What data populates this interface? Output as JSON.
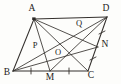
{
  "figure": {
    "type": "geometry-diagram",
    "shape": "parallelogram",
    "stroke_color": "#35312e",
    "label_color": "#1d1b19",
    "background_color": "#fdfdfb",
    "width": 121,
    "height": 84,
    "points": [
      {
        "name": "A",
        "label": "A",
        "x": 34,
        "y": 19,
        "label_x": 32,
        "label_y": 9,
        "kind": "vertex",
        "marked": true
      },
      {
        "name": "D",
        "label": "D",
        "x": 107,
        "y": 17,
        "label_x": 106,
        "label_y": 9,
        "kind": "vertex",
        "marked": false
      },
      {
        "name": "B",
        "label": "B",
        "x": 13,
        "y": 71,
        "label_x": 7,
        "label_y": 73,
        "kind": "vertex",
        "marked": false
      },
      {
        "name": "C",
        "label": "C",
        "x": 88,
        "y": 71,
        "label_x": 91,
        "label_y": 76,
        "kind": "vertex",
        "marked": false
      },
      {
        "name": "M",
        "label": "M",
        "x": 50,
        "y": 71,
        "label_x": 50,
        "label_y": 78,
        "kind": "midpoint",
        "marked": false
      },
      {
        "name": "N",
        "label": "N",
        "x": 98,
        "y": 47,
        "label_x": 105,
        "label_y": 45,
        "kind": "point-on-side",
        "marked": false
      },
      {
        "name": "P",
        "label": "P",
        "x": 42,
        "y": 48,
        "label_x": 35,
        "label_y": 46,
        "kind": "intersection",
        "marked": false
      },
      {
        "name": "O",
        "label": "O",
        "x": 62,
        "y": 49,
        "label_x": 58,
        "label_y": 53,
        "kind": "intersection",
        "marked": false
      },
      {
        "name": "Q",
        "label": "Q",
        "x": 83,
        "y": 30,
        "label_x": 79,
        "label_y": 24,
        "kind": "intersection",
        "marked": false
      }
    ],
    "segments": [
      {
        "name": "AD",
        "from": "A",
        "to": "D",
        "kind": "side"
      },
      {
        "name": "AB",
        "from": "A",
        "to": "B",
        "kind": "side"
      },
      {
        "name": "BC",
        "from": "B",
        "to": "C",
        "kind": "side"
      },
      {
        "name": "DC",
        "from": "D",
        "to": "C",
        "kind": "side"
      },
      {
        "name": "AC",
        "from": "A",
        "to": "C",
        "kind": "diagonal"
      },
      {
        "name": "BD",
        "from": "B",
        "to": "D",
        "kind": "diagonal"
      },
      {
        "name": "AM",
        "from": "A",
        "to": "M",
        "kind": "cevian"
      },
      {
        "name": "AN",
        "from": "A",
        "to": "N",
        "kind": "cevian"
      },
      {
        "name": "BN",
        "from": "B",
        "to": "N",
        "kind": "cevian"
      },
      {
        "name": "DM",
        "from": "D",
        "to": "M",
        "kind": "cevian"
      }
    ],
    "tick_marks": [
      {
        "name": "tick-BM",
        "on_segment": "BM",
        "x": 31,
        "y": 71,
        "orientation": "vertical",
        "count": 1
      },
      {
        "name": "tick-MC",
        "on_segment": "MC",
        "x": 69,
        "y": 71,
        "orientation": "vertical",
        "count": 1
      },
      {
        "name": "tick-DN",
        "on_segment": "DN",
        "x": 102,
        "y": 32,
        "orientation": "cross",
        "count": 1
      },
      {
        "name": "tick-NC",
        "on_segment": "NC",
        "x": 93,
        "y": 59,
        "orientation": "cross",
        "count": 1
      }
    ]
  }
}
